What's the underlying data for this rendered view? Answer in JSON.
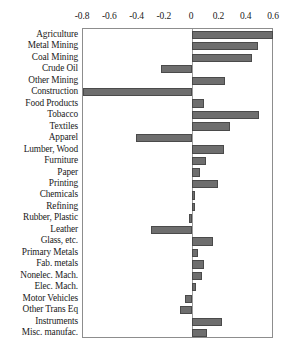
{
  "chart_data": {
    "type": "bar",
    "orientation": "horizontal",
    "title": "",
    "xlabel": "",
    "ylabel": "",
    "xlim": [
      -0.8,
      0.6
    ],
    "xticks": [
      -0.8,
      -0.6,
      -0.4,
      -0.2,
      0,
      0.2,
      0.4,
      0.6
    ],
    "xtick_labels": [
      "-0.8",
      "-0.6",
      "-0.4",
      "-0.2",
      "0",
      "0.2",
      "0.4",
      "0.6"
    ],
    "grid": false,
    "legend": null,
    "axis_position": "top",
    "bar_color": "#6e6e6e",
    "bar_edge_color": "#4a4a4a",
    "frame_color": "#8d8d8d",
    "categories": [
      "Agriculture",
      "Metal Mining",
      "Coal Mining",
      "Crude Oil",
      "Other Mining",
      "Construction",
      "Food Products",
      "Tobacco",
      "Textiles",
      "Apparel",
      "Lumber, Wood",
      "Furniture",
      "Paper",
      "Printing",
      "Chemicals",
      "Refining",
      "Rubber, Plastic",
      "Leather",
      "Glass, etc.",
      "Primary Metals",
      "Fab. metals",
      "Nonelec. Mach.",
      "Elec. Mach.",
      "Motor Vehicles",
      "Other Trans Eq",
      "Instruments",
      "Misc. manufac."
    ],
    "values": [
      0.59,
      0.48,
      0.44,
      -0.23,
      0.24,
      -0.8,
      0.09,
      0.49,
      0.28,
      -0.41,
      0.23,
      0.1,
      0.06,
      0.19,
      0.02,
      0.02,
      -0.02,
      -0.3,
      0.15,
      0.04,
      0.09,
      0.07,
      0.03,
      -0.05,
      -0.09,
      0.22,
      0.11
    ]
  }
}
